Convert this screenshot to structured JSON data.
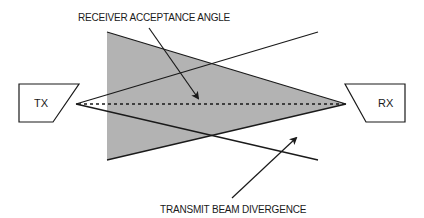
{
  "diagram": {
    "labels": {
      "receiver_acceptance": "RECEIVER ACCEPTANCE ANGLE",
      "transmit_divergence": "TRANSMIT BEAM DIVERGENCE"
    },
    "transmitter": {
      "label": "TX"
    },
    "receiver": {
      "label": "RX"
    },
    "colors": {
      "acceptance_fill": "#b3b3b3",
      "stroke": "#1a1a1a",
      "background": "#ffffff"
    }
  }
}
